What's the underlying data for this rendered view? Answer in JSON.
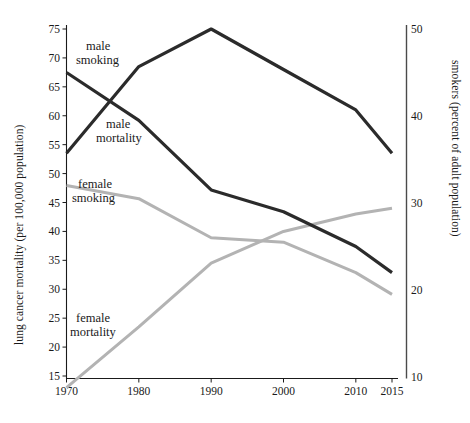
{
  "chart_data": {
    "type": "line",
    "title": "",
    "x": [
      1970,
      1980,
      1990,
      2000,
      2010,
      2015
    ],
    "xlabel": "",
    "xticks": [
      "1970",
      "1980",
      "1990",
      "2000",
      "2010",
      "2015"
    ],
    "xlim": [
      1970,
      2015
    ],
    "ylabel": "lung cancer mortality (per 100,000 population)",
    "yticks": [
      "15",
      "20",
      "25",
      "30",
      "35",
      "40",
      "45",
      "50",
      "55",
      "60",
      "65",
      "70",
      "75"
    ],
    "ylim": [
      13,
      76.5
    ],
    "y2label": "smokers (percent of adult population)",
    "y2ticks": [
      "10",
      "20",
      "30",
      "40",
      "50"
    ],
    "y2lim": [
      8.5,
      51.5
    ],
    "grid": false,
    "legend": "inline-annotations",
    "colors": {
      "mortality": "#2b2b2b",
      "smoking_male": "#2b2b2b",
      "smoking_female": "#b3b3b3",
      "mortality_female": "#b3b3b3",
      "axis": "#1a1a1a"
    },
    "series": [
      {
        "name": "male mortality",
        "axis": "left",
        "unit": "per 100,000 population",
        "color": "#2b2b2b",
        "label": "male\nmortality",
        "values": [
          53.5,
          68.5,
          75.0,
          68.0,
          61.0,
          53.5
        ]
      },
      {
        "name": "female mortality",
        "axis": "left",
        "unit": "per 100,000 population",
        "color": "#b3b3b3",
        "label": "female\nmortality",
        "values": [
          13.0,
          23.5,
          34.5,
          40.0,
          43.0,
          44.0
        ]
      },
      {
        "name": "male smoking",
        "axis": "right",
        "unit": "percent of adult population",
        "color": "#2b2b2b",
        "label": "male\nsmoking",
        "values": [
          45.0,
          39.5,
          31.5,
          29.0,
          25.0,
          22.0
        ]
      },
      {
        "name": "female smoking",
        "axis": "right",
        "unit": "percent of adult population",
        "color": "#b3b3b3",
        "label": "female\nsmoking",
        "values": [
          32.0,
          30.5,
          26.0,
          25.5,
          22.0,
          19.5
        ]
      }
    ],
    "annotations": [
      {
        "text_line1": "male",
        "text_line2": "smoking",
        "x": 86,
        "y": 50
      },
      {
        "text_line1": "male",
        "text_line2": "mortality",
        "x": 102,
        "y": 124
      },
      {
        "text_line1": "female",
        "text_line2": "smoking",
        "x": 76,
        "y": 184
      },
      {
        "text_line1": "female",
        "text_line2": "mortality",
        "x": 76,
        "y": 318
      }
    ]
  },
  "labels": {
    "male_smoking_1": "male",
    "male_smoking_2": "smoking",
    "male_mortality_1": "male",
    "male_mortality_2": "mortality",
    "female_smoking_1": "female",
    "female_smoking_2": "smoking",
    "female_mortality_1": "female",
    "female_mortality_2": "mortality"
  },
  "yaxis_left": {
    "title": "lung cancer mortality (per 100,000 population)",
    "ticks": [
      "75",
      "70",
      "65",
      "60",
      "55",
      "50",
      "45",
      "40",
      "35",
      "30",
      "25",
      "20",
      "15"
    ]
  },
  "yaxis_right": {
    "title": "smokers (percent of adult population)",
    "ticks": [
      "50",
      "40",
      "30",
      "20",
      "10"
    ]
  },
  "xaxis": {
    "ticks": [
      "1970",
      "1980",
      "1990",
      "2000",
      "2010",
      "2015"
    ]
  }
}
